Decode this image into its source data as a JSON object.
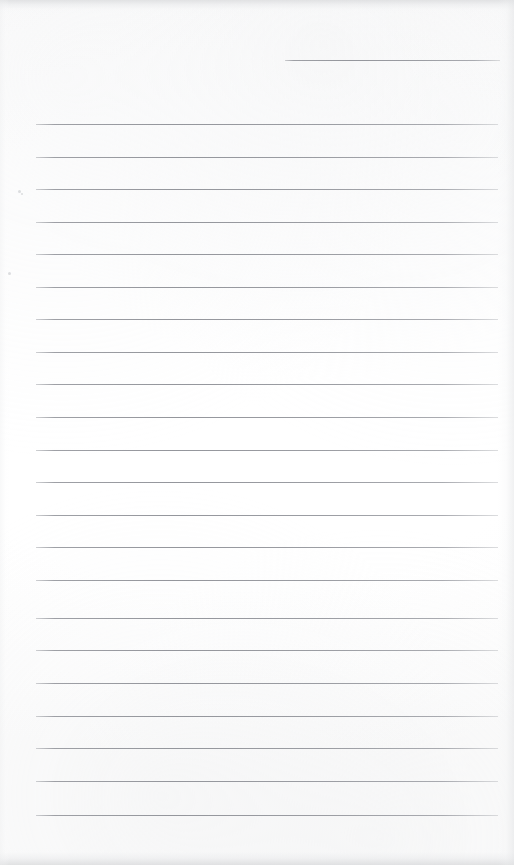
{
  "document": {
    "kind": "scanned-lined-notepad-page",
    "page_width": 514,
    "page_height": 865,
    "background_color": "#ffffff",
    "content_text": "",
    "has_handwriting": false,
    "has_printed_text": false
  },
  "paper": {
    "surface_color": "#ffffff",
    "edge_shadow_color": "#d8d9db"
  },
  "ruling": {
    "line_color": "#92949a",
    "line_thickness": 1,
    "line_spacing": 32.6,
    "left_margin_x": 36,
    "right_margin_x": 498,
    "full_line_count": 22,
    "partial_line_count": 1,
    "lines": [
      {
        "id": "rule-partial-top",
        "y": 60,
        "x_start": 285,
        "x_end": 500,
        "partial": true
      },
      {
        "id": "rule-01",
        "y": 124,
        "x_start": 36,
        "x_end": 498,
        "partial": false
      },
      {
        "id": "rule-02",
        "y": 157,
        "x_start": 36,
        "x_end": 498,
        "partial": false
      },
      {
        "id": "rule-03",
        "y": 189,
        "x_start": 36,
        "x_end": 498,
        "partial": false
      },
      {
        "id": "rule-04",
        "y": 222,
        "x_start": 36,
        "x_end": 498,
        "partial": false
      },
      {
        "id": "rule-05",
        "y": 254,
        "x_start": 36,
        "x_end": 498,
        "partial": false
      },
      {
        "id": "rule-06",
        "y": 287,
        "x_start": 36,
        "x_end": 498,
        "partial": false
      },
      {
        "id": "rule-07",
        "y": 319,
        "x_start": 36,
        "x_end": 498,
        "partial": false
      },
      {
        "id": "rule-08",
        "y": 352,
        "x_start": 36,
        "x_end": 498,
        "partial": false
      },
      {
        "id": "rule-09",
        "y": 384,
        "x_start": 36,
        "x_end": 498,
        "partial": false
      },
      {
        "id": "rule-10",
        "y": 417,
        "x_start": 36,
        "x_end": 498,
        "partial": false
      },
      {
        "id": "rule-11",
        "y": 450,
        "x_start": 36,
        "x_end": 498,
        "partial": false
      },
      {
        "id": "rule-12",
        "y": 482,
        "x_start": 36,
        "x_end": 498,
        "partial": false
      },
      {
        "id": "rule-13",
        "y": 515,
        "x_start": 36,
        "x_end": 498,
        "partial": false
      },
      {
        "id": "rule-14",
        "y": 547,
        "x_start": 36,
        "x_end": 498,
        "partial": false
      },
      {
        "id": "rule-15",
        "y": 580,
        "x_start": 36,
        "x_end": 498,
        "partial": false
      },
      {
        "id": "rule-16",
        "y": 618,
        "x_start": 36,
        "x_end": 498,
        "partial": false
      },
      {
        "id": "rule-17",
        "y": 650,
        "x_start": 36,
        "x_end": 498,
        "partial": false
      },
      {
        "id": "rule-18",
        "y": 683,
        "x_start": 36,
        "x_end": 498,
        "partial": false
      },
      {
        "id": "rule-19",
        "y": 716,
        "x_start": 36,
        "x_end": 498,
        "partial": false
      },
      {
        "id": "rule-20",
        "y": 748,
        "x_start": 36,
        "x_end": 498,
        "partial": false
      },
      {
        "id": "rule-21",
        "y": 781,
        "x_start": 36,
        "x_end": 498,
        "partial": false
      },
      {
        "id": "rule-22",
        "y": 815,
        "x_start": 36,
        "x_end": 498,
        "partial": false
      }
    ]
  },
  "artifacts": {
    "specks": [
      {
        "x": 18,
        "y": 190,
        "size": 3
      },
      {
        "x": 8,
        "y": 272,
        "size": 3
      },
      {
        "x": 21,
        "y": 193,
        "size": 2
      }
    ]
  }
}
